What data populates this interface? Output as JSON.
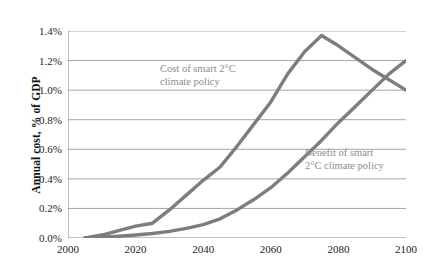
{
  "chart_data": {
    "type": "line",
    "title": "",
    "subtitle": "",
    "xlabel": "",
    "ylabel": "Annual cost, % of GDP",
    "xlim": [
      2000,
      2100
    ],
    "ylim": [
      0.0,
      1.4
    ],
    "xticks": [
      "2000",
      "2020",
      "2040",
      "2060",
      "2080",
      "2100"
    ],
    "xtick_values": [
      2000,
      2020,
      2040,
      2060,
      2080,
      2100
    ],
    "yticks": [
      "0.0%",
      "0.2%",
      "0.4%",
      "0.6%",
      "0.8%",
      "1.0%",
      "1.2%",
      "1.4%"
    ],
    "ytick_values": [
      0.0,
      0.2,
      0.4,
      0.6,
      0.8,
      1.0,
      1.2,
      1.4
    ],
    "grid": "horizontal",
    "legend_position": "inline-annotations",
    "line_color": "#7d7d7d",
    "grid_color": "#a6a6a6",
    "axis_color": "#808080",
    "annotation_color": "#8d8d8d",
    "series": [
      {
        "name": "Cost of smart 2°C climate policy",
        "annotation_lines": [
          "Cost of smart 2°C",
          "climate policy"
        ],
        "x": [
          2005,
          2010,
          2015,
          2020,
          2025,
          2030,
          2035,
          2040,
          2045,
          2050,
          2055,
          2060,
          2065,
          2070,
          2075,
          2080,
          2085,
          2090,
          2095,
          2100
        ],
        "values": [
          0.0,
          0.02,
          0.05,
          0.08,
          0.1,
          0.19,
          0.29,
          0.39,
          0.48,
          0.62,
          0.77,
          0.92,
          1.11,
          1.26,
          1.37,
          1.3,
          1.22,
          1.14,
          1.07,
          1.0
        ]
      },
      {
        "name": "Benefit of smart 2°C climate policy",
        "annotation_lines": [
          "Benefit of smart",
          "2°C climate policy"
        ],
        "x": [
          2005,
          2010,
          2015,
          2020,
          2025,
          2030,
          2035,
          2040,
          2045,
          2050,
          2055,
          2060,
          2065,
          2070,
          2075,
          2080,
          2085,
          2090,
          2095,
          2100
        ],
        "values": [
          0.0,
          0.005,
          0.012,
          0.02,
          0.03,
          0.045,
          0.065,
          0.09,
          0.13,
          0.19,
          0.26,
          0.34,
          0.44,
          0.55,
          0.66,
          0.78,
          0.89,
          1.0,
          1.11,
          1.2
        ]
      }
    ]
  }
}
